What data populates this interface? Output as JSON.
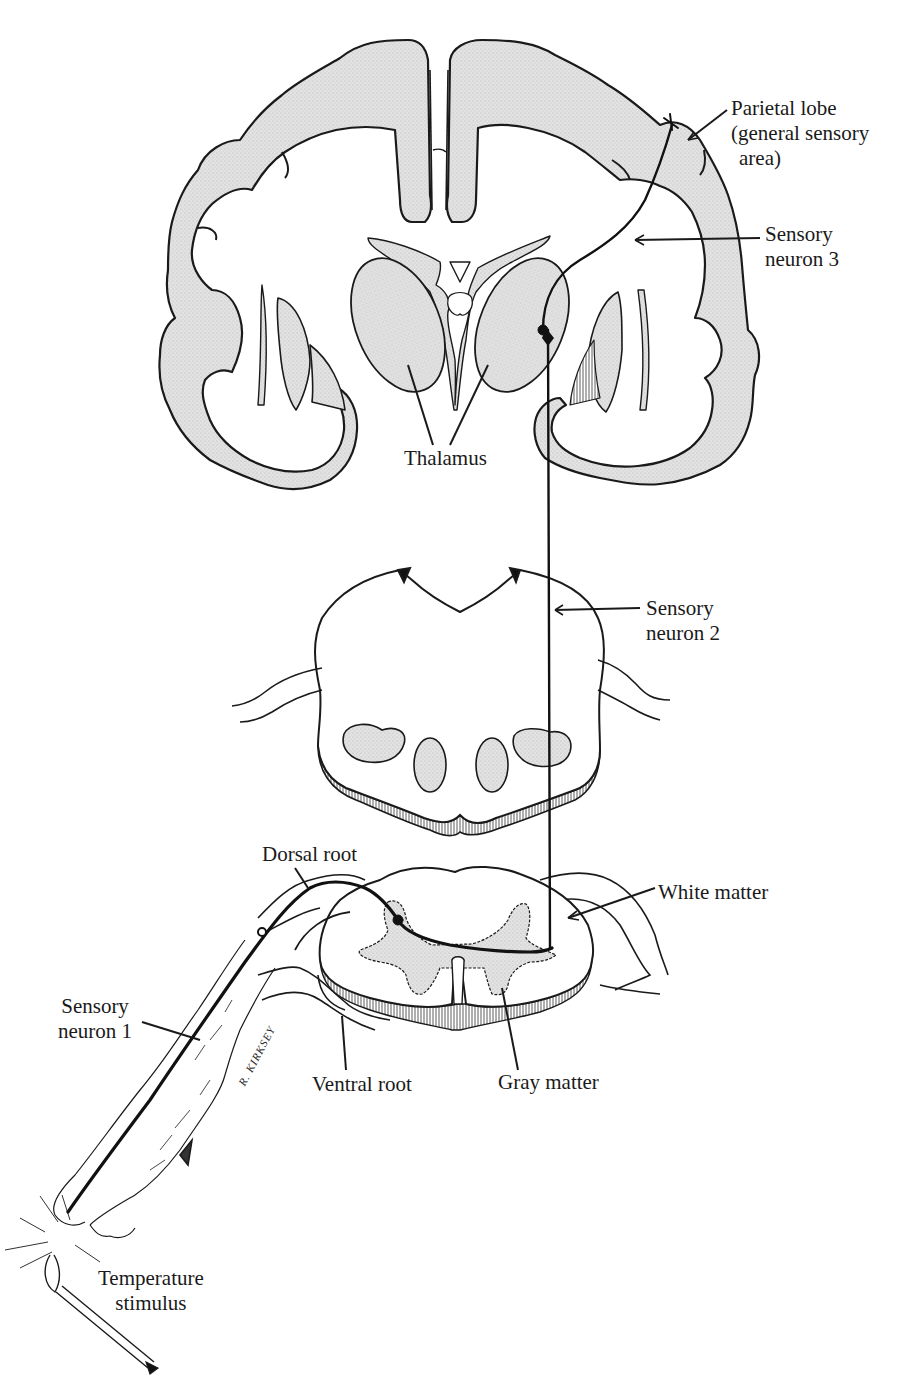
{
  "figure": {
    "colors": {
      "outline": "#1a1a1a",
      "gray_matter": "#d9d9d9",
      "background": "#ffffff",
      "neuron": "#111111"
    },
    "signature": "R. KIRKSEY"
  },
  "labels": {
    "parietal_lobe": {
      "line1": "Parietal lobe",
      "line2": "(general sensory",
      "line3": "area)"
    },
    "sensory_neuron_3": {
      "line1": "Sensory",
      "line2": "neuron 3"
    },
    "thalamus": {
      "text": "Thalamus"
    },
    "sensory_neuron_2": {
      "line1": "Sensory",
      "line2": "neuron 2"
    },
    "dorsal_root": {
      "text": "Dorsal root"
    },
    "white_matter": {
      "text": "White matter"
    },
    "sensory_neuron_1": {
      "line1": "Sensory",
      "line2": "neuron 1"
    },
    "ventral_root": {
      "text": "Ventral root"
    },
    "gray_matter": {
      "text": "Gray matter"
    },
    "temperature_stimulus": {
      "line1": "Temperature",
      "line2": "stimulus"
    }
  }
}
